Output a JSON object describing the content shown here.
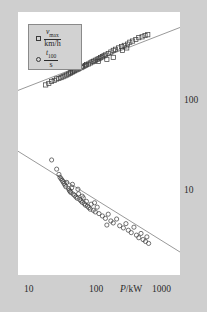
{
  "figure": {
    "background_color": "#cfcfcf",
    "plot_background": "#ffffff",
    "axis_color": "#2b2b2b"
  },
  "legend": {
    "background_color": "#d2d2d2",
    "border_color": "#8a8a8a",
    "entries": [
      {
        "marker": "open-square",
        "numerator": "v",
        "numerator_sub": "max",
        "denominator": "km/h",
        "label": "v_max / (km/h)"
      },
      {
        "marker": "open-circle",
        "numerator": "t",
        "numerator_sub": "100",
        "denominator": "s",
        "label": "t_100 / s"
      }
    ]
  },
  "axes": {
    "x": {
      "label": "P/kW",
      "label_symbol": "P",
      "label_unit": "/kW",
      "scale": "log",
      "ticks": [
        "10",
        "100",
        "1000"
      ],
      "min": 10,
      "max": 1000
    },
    "y": {
      "label": "",
      "scale": "log",
      "ticks": [
        "10",
        "100"
      ],
      "ticks_position": "right",
      "min": 3,
      "max": 400
    }
  },
  "chart_data": {
    "type": "scatter",
    "title": "",
    "subtitle": "",
    "xlabel": "P/kW",
    "ylabel": "",
    "xscale": "log",
    "yscale": "log",
    "xlim": [
      10,
      1000
    ],
    "ylim": [
      3,
      400
    ],
    "grid": false,
    "legend_position": "top-left",
    "annotations": [],
    "series": [
      {
        "name": "v_max / (km/h)",
        "marker": "open-square",
        "color": "#3a3a3a",
        "trendline": {
          "type": "power-law",
          "x": [
            10,
            1000
          ],
          "y": [
            93,
            300
          ],
          "color": "#6d6d6d"
        },
        "points": [
          [
            22,
            103
          ],
          [
            24,
            106
          ],
          [
            26,
            110
          ],
          [
            28,
            112
          ],
          [
            30,
            115
          ],
          [
            32,
            116
          ],
          [
            34,
            118
          ],
          [
            36,
            120
          ],
          [
            38,
            122
          ],
          [
            40,
            124
          ],
          [
            42,
            126
          ],
          [
            44,
            128
          ],
          [
            45,
            130
          ],
          [
            47,
            131
          ],
          [
            48,
            133
          ],
          [
            50,
            134
          ],
          [
            52,
            136
          ],
          [
            55,
            138
          ],
          [
            57,
            140
          ],
          [
            60,
            142
          ],
          [
            62,
            144
          ],
          [
            65,
            146
          ],
          [
            68,
            148
          ],
          [
            70,
            150
          ],
          [
            74,
            152
          ],
          [
            78,
            155
          ],
          [
            82,
            158
          ],
          [
            86,
            160
          ],
          [
            90,
            163
          ],
          [
            95,
            166
          ],
          [
            100,
            168
          ],
          [
            105,
            171
          ],
          [
            110,
            174
          ],
          [
            115,
            177
          ],
          [
            120,
            180
          ],
          [
            130,
            185
          ],
          [
            140,
            190
          ],
          [
            150,
            196
          ],
          [
            160,
            200
          ],
          [
            175,
            205
          ],
          [
            190,
            210
          ],
          [
            205,
            215
          ],
          [
            225,
            220
          ],
          [
            240,
            228
          ],
          [
            260,
            233
          ],
          [
            285,
            240
          ],
          [
            310,
            248
          ],
          [
            340,
            252
          ],
          [
            370,
            258
          ],
          [
            400,
            262
          ],
          [
            150,
            172
          ],
          [
            195,
            196
          ],
          [
            220,
            205
          ],
          [
            125,
            166
          ],
          [
            98,
            160
          ]
        ]
      },
      {
        "name": "t_100 / s",
        "marker": "open-circle",
        "color": "#3a3a3a",
        "trendline": {
          "type": "power-law",
          "x": [
            10,
            1000
          ],
          "y": [
            30,
            4.6
          ],
          "color": "#6d6d6d"
        },
        "points": [
          [
            26,
            25.5
          ],
          [
            30,
            21.5
          ],
          [
            32,
            19.5
          ],
          [
            33,
            18.5
          ],
          [
            34,
            18.0
          ],
          [
            35,
            17.5
          ],
          [
            36,
            17.0
          ],
          [
            37,
            16.5
          ],
          [
            38,
            16.0
          ],
          [
            39,
            15.5
          ],
          [
            40,
            16.8
          ],
          [
            42,
            15.0
          ],
          [
            43,
            14.5
          ],
          [
            44,
            14.2
          ],
          [
            45,
            13.9
          ],
          [
            46,
            15.2
          ],
          [
            48,
            13.5
          ],
          [
            50,
            13.2
          ],
          [
            52,
            12.8
          ],
          [
            54,
            12.5
          ],
          [
            56,
            13.6
          ],
          [
            58,
            12.2
          ],
          [
            60,
            11.9
          ],
          [
            62,
            11.6
          ],
          [
            64,
            12.6
          ],
          [
            66,
            11.3
          ],
          [
            68,
            11.0
          ],
          [
            70,
            11.8
          ],
          [
            72,
            10.8
          ],
          [
            75,
            10.5
          ],
          [
            78,
            10.2
          ],
          [
            80,
            11.2
          ],
          [
            85,
            10.0
          ],
          [
            90,
            9.7
          ],
          [
            95,
            10.6
          ],
          [
            100,
            9.4
          ],
          [
            110,
            9.0
          ],
          [
            120,
            8.6
          ],
          [
            130,
            9.3
          ],
          [
            140,
            8.2
          ],
          [
            150,
            7.9
          ],
          [
            165,
            8.5
          ],
          [
            180,
            7.5
          ],
          [
            200,
            7.2
          ],
          [
            215,
            7.8
          ],
          [
            230,
            6.9
          ],
          [
            250,
            6.6
          ],
          [
            270,
            7.3
          ],
          [
            290,
            6.3
          ],
          [
            310,
            6.0
          ],
          [
            330,
            6.5
          ],
          [
            350,
            5.8
          ],
          [
            375,
            5.6
          ],
          [
            390,
            6.1
          ],
          [
            410,
            5.4
          ],
          [
            55,
            14.8
          ],
          [
            47,
            16.2
          ],
          [
            62,
            13.0
          ],
          [
            88,
            11.5
          ],
          [
            125,
            7.6
          ]
        ]
      }
    ]
  }
}
